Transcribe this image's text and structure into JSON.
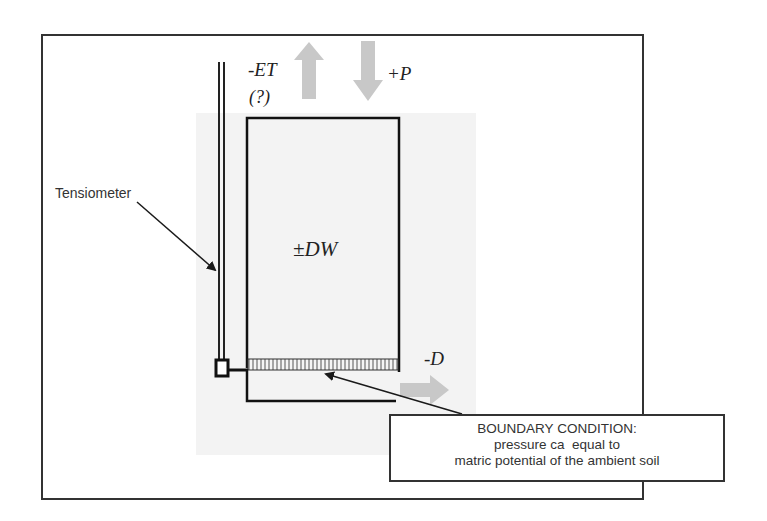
{
  "diagram": {
    "labels": {
      "evapotranspiration": "-ET",
      "evapotranspiration_uncertain": "(?)",
      "precipitation": "+P",
      "storage_change": "±DW",
      "drainage": "-D",
      "tensiometer": "Tensiometer"
    },
    "boundary_condition": {
      "title": "BOUNDARY CONDITION:",
      "line1": "pressure ca  equal to",
      "line2": "matric potential of the ambient soil"
    },
    "colors": {
      "frame": "#333333",
      "arrow_fill": "#c8c8c8",
      "soil_background": "#f3f3f3",
      "line": "#1a1a1a"
    }
  }
}
